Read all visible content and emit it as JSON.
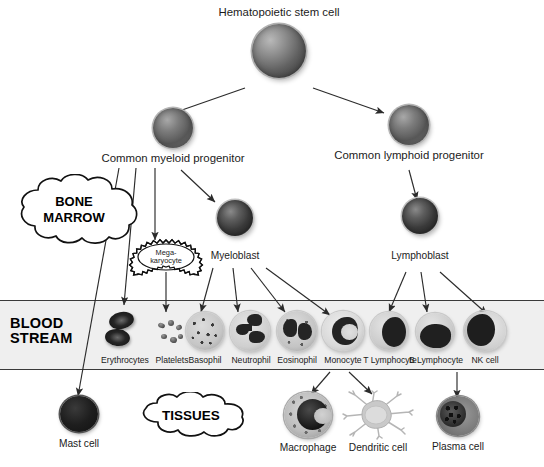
{
  "figure": {
    "compartments": [
      {
        "id": "bone-marrow",
        "label_line1": "BONE",
        "label_line2": "MARROW"
      },
      {
        "id": "blood-stream",
        "label_line1": "BLOOD",
        "label_line2": "STREAM"
      },
      {
        "id": "tissues",
        "label_line1": "TISSUES",
        "label_line2": ""
      }
    ],
    "nodes": {
      "stem": {
        "label": "Hematopoietic stem cell"
      },
      "cmp": {
        "label": "Common myeloid progenitor"
      },
      "clp": {
        "label": "Common lymphoid progenitor"
      },
      "megakaryocyte": {
        "label_line1": "Mega-",
        "label_line2": "karyocyte"
      },
      "myeloblast": {
        "label": "Myeloblast"
      },
      "lymphoblast": {
        "label": "Lymphoblast"
      },
      "erythrocytes": {
        "label": "Erythrocytes"
      },
      "platelets": {
        "label": "Platelets"
      },
      "basophil": {
        "label": "Basophil"
      },
      "neutrophil": {
        "label": "Neutrophil"
      },
      "eosinophil": {
        "label": "Eosinophil"
      },
      "monocyte": {
        "label": "Monocyte"
      },
      "t_lymphocyte": {
        "label": "T Lymphocyte"
      },
      "b_lymphocyte": {
        "label": "B Lymphocyte"
      },
      "nk_cell": {
        "label": "NK cell"
      },
      "mast_cell": {
        "label": "Mast cell"
      },
      "macrophage": {
        "label": "Macrophage"
      },
      "dendritic_cell": {
        "label": "Dendritic cell"
      },
      "plasma_cell": {
        "label": "Plasma cell"
      }
    },
    "edges": [
      {
        "from": "stem",
        "to": "cmp"
      },
      {
        "from": "stem",
        "to": "clp"
      },
      {
        "from": "cmp",
        "to": "mast_cell"
      },
      {
        "from": "cmp",
        "to": "erythrocytes"
      },
      {
        "from": "cmp",
        "to": "megakaryocyte"
      },
      {
        "from": "cmp",
        "to": "myeloblast"
      },
      {
        "from": "megakaryocyte",
        "to": "platelets"
      },
      {
        "from": "myeloblast",
        "to": "basophil"
      },
      {
        "from": "myeloblast",
        "to": "neutrophil"
      },
      {
        "from": "myeloblast",
        "to": "eosinophil"
      },
      {
        "from": "myeloblast",
        "to": "monocyte"
      },
      {
        "from": "clp",
        "to": "lymphoblast"
      },
      {
        "from": "lymphoblast",
        "to": "t_lymphocyte"
      },
      {
        "from": "lymphoblast",
        "to": "b_lymphocyte"
      },
      {
        "from": "lymphoblast",
        "to": "nk_cell"
      },
      {
        "from": "monocyte",
        "to": "macrophage"
      },
      {
        "from": "monocyte",
        "to": "dendritic_cell"
      },
      {
        "from": "b_lymphocyte",
        "to": "plasma_cell"
      }
    ],
    "colors": {
      "background": "#ffffff",
      "band_fill": "#efefef",
      "band_border": "#3a3a3a",
      "stroke": "#2b2b2b",
      "text": "#1a1a1a"
    }
  }
}
